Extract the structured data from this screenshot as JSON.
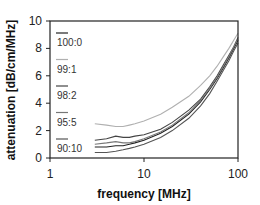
{
  "chart_data": {
    "type": "line",
    "title": "",
    "xlabel": "frequency [MHz]",
    "ylabel": "attenuation [dB/cm/MHz]",
    "xscale": "log",
    "xlim": [
      1,
      100
    ],
    "ylim": [
      0,
      10
    ],
    "xticks": [
      "1",
      "10",
      "100"
    ],
    "yticks": [
      "0",
      "2",
      "4",
      "6",
      "8",
      "10"
    ],
    "grid": false,
    "legend_position": "upper left (inside)",
    "x": [
      3,
      4,
      5,
      6,
      7,
      8,
      10,
      15,
      20,
      30,
      40,
      50,
      60,
      70,
      80,
      90,
      100
    ],
    "series": [
      {
        "name": "100:0",
        "color": "#222222",
        "values": [
          0.8,
          0.8,
          0.9,
          0.9,
          1.0,
          1.1,
          1.3,
          1.8,
          2.3,
          3.2,
          4.1,
          5.0,
          5.8,
          6.6,
          7.3,
          8.0,
          8.6
        ]
      },
      {
        "name": "99:1",
        "color": "#b0b0b0",
        "values": [
          2.5,
          2.4,
          2.3,
          2.3,
          2.4,
          2.5,
          2.7,
          3.2,
          3.7,
          4.5,
          5.3,
          6.0,
          6.7,
          7.4,
          8.0,
          8.6,
          9.1
        ]
      },
      {
        "name": "98:2",
        "color": "#444444",
        "values": [
          1.3,
          1.4,
          1.6,
          1.5,
          1.5,
          1.6,
          1.7,
          2.1,
          2.6,
          3.5,
          4.3,
          5.2,
          6.0,
          6.8,
          7.5,
          8.1,
          8.8
        ]
      },
      {
        "name": "95:5",
        "color": "#777777",
        "values": [
          1.0,
          1.1,
          1.2,
          1.1,
          1.1,
          1.2,
          1.4,
          1.9,
          2.4,
          3.3,
          4.2,
          5.1,
          5.9,
          6.7,
          7.4,
          8.1,
          8.7
        ]
      },
      {
        "name": "90:10",
        "color": "#555555",
        "values": [
          0.4,
          0.4,
          0.5,
          0.6,
          0.7,
          0.8,
          1.0,
          1.5,
          2.0,
          2.9,
          3.8,
          4.7,
          5.6,
          6.4,
          7.1,
          7.8,
          8.4
        ]
      }
    ]
  }
}
